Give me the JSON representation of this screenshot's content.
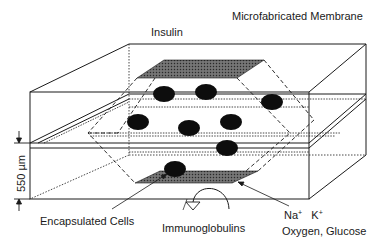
{
  "diagram": {
    "title": "Microfabricated Membrane",
    "labels": {
      "insulin": "Insulin",
      "membrane": "Microfabricated Membrane",
      "dimension": "550 µm",
      "encapsulated_cells": "Encapsulated Cells",
      "immunoglobulins": "Immunoglobulins",
      "na": "Na",
      "na_sup": "+",
      "k": "K",
      "k_sup": "+",
      "oxygen_glucose": "Oxygen, Glucose"
    },
    "colors": {
      "stroke": "#1a1a1a",
      "cell_fill": "#0d0d0d",
      "shaded_fill": "#555555",
      "background": "#ffffff"
    },
    "components": [
      "outer box (capsule)",
      "upper membrane layer",
      "lower membrane layer",
      "top shaded membrane window",
      "bottom shaded membrane window",
      "encapsulated cells (8)",
      "dimension marker 550 µm",
      "curved arrow (immunoglobulins blocked)",
      "pointer arrows"
    ],
    "cell_count": 8
  }
}
